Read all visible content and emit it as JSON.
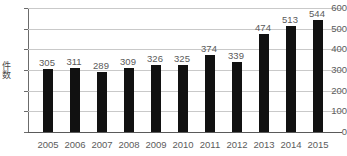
{
  "chart_data": {
    "type": "bar",
    "title": "",
    "xlabel": "",
    "ylabel": "件数",
    "categories": [
      "2005",
      "2006",
      "2007",
      "2008",
      "2009",
      "2010",
      "2011",
      "2012",
      "2013",
      "2014",
      "2015"
    ],
    "values": [
      305,
      311,
      289,
      309,
      326,
      325,
      374,
      339,
      474,
      513,
      544
    ],
    "ylim": [
      0,
      600
    ],
    "ytick_labels": [
      "0",
      "100",
      "200",
      "300",
      "400",
      "500",
      "600"
    ],
    "ytick_values": [
      0,
      100,
      200,
      300,
      400,
      500,
      600
    ],
    "grid": true,
    "legend": false,
    "show_data_labels": true,
    "colors": {
      "bar": "#111111",
      "gridline": "#c9c9c9",
      "axis": "#5a5a5a",
      "text": "#5c5c5c",
      "background": "#ffffff"
    }
  }
}
